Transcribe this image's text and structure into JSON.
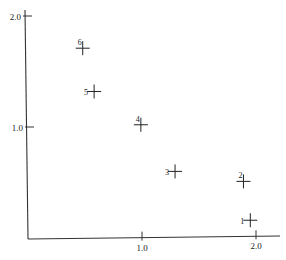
{
  "chart_data": {
    "type": "scatter",
    "title": "",
    "xlabel": "",
    "ylabel": "",
    "xlim": [
      0,
      2.2
    ],
    "ylim": [
      0,
      2.0
    ],
    "grid": false,
    "legend": null,
    "marker": "plus",
    "x_ticks": [
      {
        "value": 1.0,
        "label": "1.0"
      },
      {
        "value": 2.0,
        "label": "2.0"
      }
    ],
    "y_ticks": [
      {
        "value": 1.0,
        "label": "1.0"
      },
      {
        "value": 2.0,
        "label": "2.0"
      }
    ],
    "points": [
      {
        "label": "1",
        "x": 1.95,
        "y": 0.16
      },
      {
        "label": "2",
        "x": 1.89,
        "y": 0.51
      },
      {
        "label": "3",
        "x": 1.29,
        "y": 0.6
      },
      {
        "label": "4",
        "x": 0.99,
        "y": 1.02
      },
      {
        "label": "5",
        "x": 0.58,
        "y": 1.32
      },
      {
        "label": "6",
        "x": 0.48,
        "y": 1.71
      }
    ],
    "colors": {
      "axis": "#333333",
      "marker": "#222222",
      "text": "#222222"
    }
  }
}
